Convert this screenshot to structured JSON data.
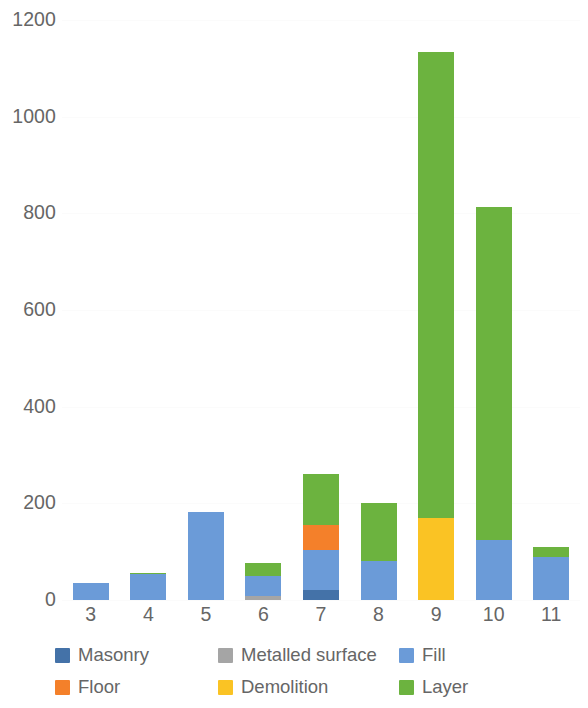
{
  "chart_data": {
    "type": "bar",
    "subtype": "stacked-bar",
    "title": "",
    "xlabel": "",
    "ylabel": "",
    "categories": [
      "3",
      "4",
      "5",
      "6",
      "7",
      "8",
      "9",
      "10",
      "11"
    ],
    "ylim": [
      0,
      1200
    ],
    "yticks": [
      0,
      200,
      400,
      600,
      800,
      1000,
      1200
    ],
    "ytick_labels": [
      "0",
      "200",
      "400",
      "600",
      "800",
      "1000",
      "1200"
    ],
    "grid": true,
    "legend_position": "bottom",
    "series": [
      {
        "name": "Masonry",
        "color": "#4472a8",
        "values": [
          0,
          0,
          0,
          0,
          20,
          0,
          0,
          0,
          0
        ]
      },
      {
        "name": "Metalled surface",
        "color": "#a5a5a5",
        "values": [
          0,
          0,
          0,
          8,
          0,
          0,
          0,
          0,
          0
        ]
      },
      {
        "name": "Fill",
        "color": "#6b9bd8",
        "values": [
          35,
          53,
          183,
          42,
          83,
          80,
          0,
          125,
          88
        ]
      },
      {
        "name": "Floor",
        "color": "#f4802a",
        "values": [
          0,
          0,
          0,
          0,
          52,
          0,
          0,
          0,
          0
        ]
      },
      {
        "name": "Demolition",
        "color": "#fac324",
        "values": [
          0,
          0,
          0,
          0,
          0,
          0,
          170,
          0,
          0
        ]
      },
      {
        "name": "Layer",
        "color": "#6cb33f",
        "values": [
          0,
          3,
          0,
          27,
          105,
          120,
          963,
          688,
          22
        ]
      }
    ],
    "totals": [
      35,
      56,
      183,
      77,
      260,
      200,
      1133,
      813,
      110
    ]
  },
  "legend": {
    "items": [
      {
        "label": "Masonry",
        "color": "#4472a8"
      },
      {
        "label": "Metalled surface",
        "color": "#a5a5a5"
      },
      {
        "label": "Fill",
        "color": "#6b9bd8"
      },
      {
        "label": "Floor",
        "color": "#f4802a"
      },
      {
        "label": "Demolition",
        "color": "#fac324"
      },
      {
        "label": "Layer",
        "color": "#6cb33f"
      }
    ]
  }
}
